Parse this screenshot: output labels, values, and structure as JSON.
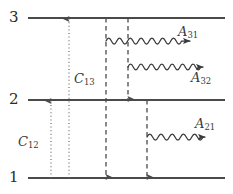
{
  "figure": {
    "type": "energy-level-diagram",
    "width": 233,
    "height": 194,
    "background_color": "#ffffff",
    "line_color": "#4a4a4a",
    "text_color": "#2b2b2b"
  },
  "levels": [
    {
      "id": "level-3",
      "label": "3",
      "y": 18,
      "x_start": 28,
      "x_end": 225
    },
    {
      "id": "level-2",
      "label": "2",
      "y": 100,
      "x_start": 28,
      "x_end": 225
    },
    {
      "id": "level-1",
      "label": "1",
      "y": 178,
      "x_start": 28,
      "x_end": 225
    }
  ],
  "collisional_transitions": [
    {
      "id": "C12",
      "label": "C",
      "sub": "12",
      "style": "dotted",
      "x": 51,
      "from_y": 178,
      "to_y": 100,
      "direction": "up",
      "label_x": 18,
      "label_y": 135
    },
    {
      "id": "C13",
      "label": "C",
      "sub": "13",
      "style": "dotted",
      "x": 69,
      "from_y": 178,
      "to_y": 18,
      "direction": "up",
      "label_x": 74,
      "label_y": 72
    }
  ],
  "radiative_decays": [
    {
      "id": "A31",
      "label": "A",
      "sub": "31",
      "style": "dashed",
      "x": 106,
      "from_y": 18,
      "to_y": 178,
      "direction": "down",
      "wave_y": 41,
      "wave_x_start": 106,
      "wave_x_end": 196,
      "label_x": 178,
      "label_y": 25
    },
    {
      "id": "A32",
      "label": "A",
      "sub": "32",
      "style": "dashed",
      "x": 128,
      "from_y": 18,
      "to_y": 100,
      "direction": "down",
      "wave_y": 67,
      "wave_x_start": 128,
      "wave_x_end": 209,
      "label_x": 191,
      "label_y": 71
    },
    {
      "id": "A21",
      "label": "A",
      "sub": "21",
      "style": "dashed",
      "x": 147,
      "from_y": 100,
      "to_y": 178,
      "direction": "down",
      "wave_y": 137,
      "wave_x_start": 147,
      "wave_x_end": 212,
      "label_x": 195,
      "label_y": 117
    }
  ]
}
